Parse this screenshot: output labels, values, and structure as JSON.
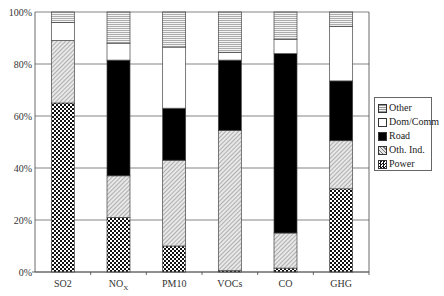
{
  "chart_data": {
    "type": "bar",
    "stacked": true,
    "percent": true,
    "title": "",
    "xlabel": "",
    "ylabel": "",
    "ylim": [
      0,
      100
    ],
    "yticks": [
      "0%",
      "20%",
      "40%",
      "60%",
      "80%",
      "100%"
    ],
    "grid": true,
    "legend_position": "right",
    "categories": [
      "SO2",
      "NOX",
      "PM10",
      "VOCs",
      "CO",
      "GHG"
    ],
    "series": [
      {
        "name": "Power",
        "pattern": "checker",
        "values": [
          65,
          21,
          10,
          0.5,
          1.5,
          32
        ]
      },
      {
        "name": "Oth. Ind.",
        "pattern": "diagonal",
        "values": [
          24,
          16,
          33,
          54,
          13.5,
          18.5
        ]
      },
      {
        "name": "Road",
        "pattern": "solid-black",
        "values": [
          0,
          44.5,
          20,
          27,
          69,
          23
        ]
      },
      {
        "name": "Dom/Comm",
        "pattern": "white",
        "values": [
          7,
          6.5,
          23.5,
          3,
          5.5,
          21
        ]
      },
      {
        "name": "Other",
        "pattern": "horizontal",
        "values": [
          4,
          12,
          13.5,
          15.5,
          10.5,
          5.5
        ]
      }
    ]
  },
  "legend": {
    "items": [
      "Other",
      "Dom/Comm",
      "Road",
      "Oth. Ind.",
      "Power"
    ]
  }
}
